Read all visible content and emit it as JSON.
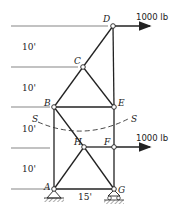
{
  "diagram": {
    "type": "truss",
    "joints": {
      "A": {
        "label": "A",
        "x": 54,
        "y": 189
      },
      "B": {
        "label": "B",
        "x": 54,
        "y": 107
      },
      "C": {
        "label": "C",
        "x": 83,
        "y": 67
      },
      "D": {
        "label": "D",
        "x": 113,
        "y": 26
      },
      "E": {
        "label": "E",
        "x": 114,
        "y": 107
      },
      "F": {
        "label": "F",
        "x": 114,
        "y": 147
      },
      "G": {
        "label": "G",
        "x": 114,
        "y": 189
      },
      "H": {
        "label": "H",
        "x": 84,
        "y": 147
      }
    },
    "members": [
      "A-B",
      "B-C",
      "C-D",
      "D-E",
      "C-E",
      "B-E",
      "E-F",
      "F-G",
      "A-G",
      "A-H",
      "H-G",
      "H-F",
      "B-H"
    ],
    "loads": [
      {
        "joint": "D",
        "label": "1000 lb",
        "direction": "right"
      },
      {
        "joint": "F",
        "label": "1000 lb",
        "direction": "right"
      }
    ],
    "dimensions": {
      "vertical": [
        "10'",
        "10'",
        "10'",
        "10'"
      ],
      "horizontal": "15'"
    },
    "section": {
      "label_left": "S",
      "label_right": "S"
    },
    "supports": {
      "A": "pin",
      "G": "roller"
    },
    "colors": {
      "line": "#222222",
      "background": "#ffffff"
    }
  }
}
